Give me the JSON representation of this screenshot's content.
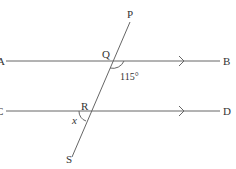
{
  "diagram": {
    "labels": {
      "P": "P",
      "Q": "Q",
      "R": "R",
      "S": "S",
      "A": "A",
      "B": "B",
      "C": "C",
      "D": "D",
      "angle_value": "115°",
      "unknown_angle": "x"
    },
    "colors": {
      "line": "#555555",
      "text": "#333333"
    }
  }
}
